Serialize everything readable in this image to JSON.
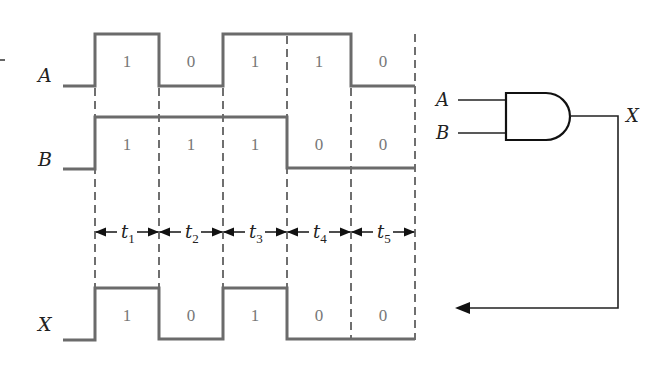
{
  "diagram": {
    "type": "timing-diagram-and-gate",
    "signals": [
      {
        "name": "A",
        "bits": [
          "1",
          "0",
          "1",
          "1",
          "0"
        ]
      },
      {
        "name": "B",
        "bits": [
          "1",
          "1",
          "1",
          "0",
          "0"
        ]
      },
      {
        "name": "X",
        "bits": [
          "1",
          "0",
          "1",
          "0",
          "0"
        ]
      }
    ],
    "intervals": [
      "t1",
      "t2",
      "t3",
      "t4",
      "t5"
    ],
    "interval_labels": [
      {
        "t": "t",
        "sub": "1"
      },
      {
        "t": "t",
        "sub": "2"
      },
      {
        "t": "t",
        "sub": "3"
      },
      {
        "t": "t",
        "sub": "4"
      },
      {
        "t": "t",
        "sub": "5"
      }
    ],
    "gate": {
      "kind": "AND",
      "inputs": [
        "A",
        "B"
      ],
      "output": "X"
    },
    "colors": {
      "waveform": "#6b6b6b",
      "line": "#222222",
      "bit_text": "#777777"
    }
  }
}
